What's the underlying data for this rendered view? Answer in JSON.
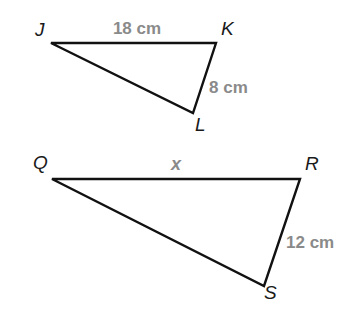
{
  "diagram": {
    "type": "similar-triangles",
    "colors": {
      "edge": "#111111",
      "vertex_label": "#1a1a1a",
      "measure_label": "#8a8a8a",
      "background": "#ffffff"
    },
    "triangles": [
      {
        "name": "JKL",
        "vertices": [
          {
            "label": "J",
            "x": 51,
            "y": 43,
            "lx": 35,
            "ly": 36
          },
          {
            "label": "K",
            "x": 216,
            "y": 43,
            "lx": 221,
            "ly": 35
          },
          {
            "label": "L",
            "x": 193,
            "y": 113,
            "lx": 195,
            "ly": 131
          }
        ],
        "sides": [
          {
            "between": "JK",
            "label": "18 cm",
            "lx": 137,
            "ly": 34
          },
          {
            "between": "KL",
            "label": "8 cm",
            "lx": 209,
            "ly": 93
          }
        ]
      },
      {
        "name": "QRS",
        "vertices": [
          {
            "label": "Q",
            "x": 52,
            "y": 179,
            "lx": 33,
            "ly": 169
          },
          {
            "label": "R",
            "x": 300,
            "y": 179,
            "lx": 305,
            "ly": 170
          },
          {
            "label": "S",
            "x": 264,
            "y": 286,
            "lx": 264,
            "ly": 299
          }
        ],
        "sides": [
          {
            "between": "QR",
            "label": "x",
            "lx": 176,
            "ly": 170
          },
          {
            "between": "RS",
            "label": "12 cm",
            "lx": 286,
            "ly": 248
          }
        ]
      }
    ]
  }
}
